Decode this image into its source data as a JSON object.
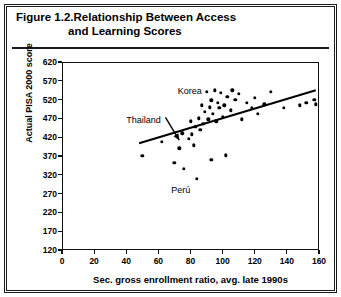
{
  "figure": {
    "number": "Figure 1.2.",
    "title_line1": "Relationship Between Access",
    "title_line2": "and Learning Scores"
  },
  "chart_data": {
    "type": "scatter",
    "title": "Figure 1.2. Relationship Between Access and Learning Scores",
    "xlabel": "Sec. gross enrollment ratio, avg. late 1990s",
    "ylabel": "Actual PISA 2000 score",
    "xlim": [
      0,
      160
    ],
    "ylim": [
      120,
      620
    ],
    "xticks": [
      0,
      20,
      40,
      60,
      80,
      100,
      120,
      140,
      160
    ],
    "yticks": [
      120,
      170,
      220,
      270,
      320,
      370,
      420,
      470,
      520,
      570,
      620
    ],
    "grid": false,
    "legend": null,
    "points": [
      {
        "x": 50,
        "y": 370
      },
      {
        "x": 62,
        "y": 408
      },
      {
        "x": 70,
        "y": 352
      },
      {
        "x": 73,
        "y": 390
      },
      {
        "x": 75,
        "y": 430
      },
      {
        "x": 76,
        "y": 336
      },
      {
        "x": 79,
        "y": 415
      },
      {
        "x": 80,
        "y": 462
      },
      {
        "x": 81,
        "y": 428
      },
      {
        "x": 82,
        "y": 398
      },
      {
        "x": 83,
        "y": 448
      },
      {
        "x": 84,
        "y": 310
      },
      {
        "x": 85,
        "y": 470
      },
      {
        "x": 86,
        "y": 440
      },
      {
        "x": 87,
        "y": 505
      },
      {
        "x": 88,
        "y": 455
      },
      {
        "x": 89,
        "y": 488
      },
      {
        "x": 90,
        "y": 540
      },
      {
        "x": 91,
        "y": 468
      },
      {
        "x": 92,
        "y": 500
      },
      {
        "x": 93,
        "y": 518
      },
      {
        "x": 93,
        "y": 360
      },
      {
        "x": 94,
        "y": 482
      },
      {
        "x": 95,
        "y": 545
      },
      {
        "x": 96,
        "y": 462
      },
      {
        "x": 97,
        "y": 512
      },
      {
        "x": 98,
        "y": 498
      },
      {
        "x": 99,
        "y": 538
      },
      {
        "x": 100,
        "y": 475
      },
      {
        "x": 101,
        "y": 505
      },
      {
        "x": 102,
        "y": 372
      },
      {
        "x": 103,
        "y": 528
      },
      {
        "x": 105,
        "y": 492
      },
      {
        "x": 106,
        "y": 545
      },
      {
        "x": 108,
        "y": 520
      },
      {
        "x": 110,
        "y": 535
      },
      {
        "x": 112,
        "y": 468
      },
      {
        "x": 115,
        "y": 512
      },
      {
        "x": 118,
        "y": 498
      },
      {
        "x": 120,
        "y": 525
      },
      {
        "x": 122,
        "y": 482
      },
      {
        "x": 126,
        "y": 508
      },
      {
        "x": 130,
        "y": 540
      },
      {
        "x": 138,
        "y": 498
      },
      {
        "x": 148,
        "y": 505
      },
      {
        "x": 152,
        "y": 512
      },
      {
        "x": 157,
        "y": 520
      },
      {
        "x": 158,
        "y": 508
      }
    ],
    "trendline": {
      "x_start": 48,
      "y_start": 404,
      "x_end": 158,
      "y_end": 545
    },
    "annotations": [
      {
        "label": "Korea",
        "x": 72,
        "y": 540,
        "has_arrow": false
      },
      {
        "label": "Thailand",
        "x": 40,
        "y": 462,
        "has_arrow": true,
        "arrow_to_x": 73,
        "arrow_to_y": 412
      },
      {
        "label": "Perú",
        "x": 68,
        "y": 278,
        "has_arrow": false
      }
    ]
  }
}
